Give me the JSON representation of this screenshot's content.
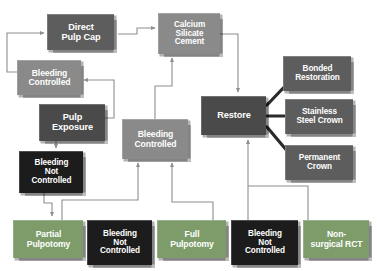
{
  "diagram": {
    "palette": {
      "gray_mid": "#8a8a8a",
      "gray_dark": "#5d5d5d",
      "charcoal": "#4a4a4a",
      "near_black": "#1c1c1c",
      "green": "#7d9c6a",
      "connector": "#8e8e8e",
      "connector_thick": "#2b2b2b",
      "background": "#ffffff",
      "text": "#ffffff"
    },
    "nodes": [
      {
        "id": "direct-pulp-cap",
        "label": "Direct\nPulp Cap",
        "theme": "t-gray-dark",
        "x": 47,
        "y": 14,
        "w": 67,
        "h": 36,
        "size": "fs-9"
      },
      {
        "id": "calcium-silicate-cement",
        "label": "Calcium\nSilicate\nCement",
        "theme": "t-gray-mid",
        "x": 158,
        "y": 13,
        "w": 62,
        "h": 41,
        "size": "fs-8"
      },
      {
        "id": "bleeding-controlled-1",
        "label": "Bleeding\nControlled",
        "theme": "t-gray-mid",
        "x": 17,
        "y": 60,
        "w": 64,
        "h": 35,
        "size": "fs-85"
      },
      {
        "id": "pulp-exposure",
        "label": "Pulp\nExposure",
        "theme": "t-charcoal",
        "x": 39,
        "y": 104,
        "w": 66,
        "h": 37,
        "size": "fs-9"
      },
      {
        "id": "bleeding-controlled-2",
        "label": "Bleeding\nControlled",
        "theme": "t-gray-mid",
        "x": 122,
        "y": 119,
        "w": 66,
        "h": 40,
        "size": "fs-85"
      },
      {
        "id": "restore",
        "label": "Restore",
        "theme": "t-charcoal",
        "x": 201,
        "y": 96,
        "w": 65,
        "h": 39,
        "size": "fs-9"
      },
      {
        "id": "bonded-restoration",
        "label": "Bonded\nRestoration",
        "theme": "t-gray-dark",
        "x": 283,
        "y": 56,
        "w": 68,
        "h": 35,
        "size": "fs-8"
      },
      {
        "id": "stainless-steel-crown",
        "label": "Stainless\nSteel Crown",
        "theme": "t-gray-dark",
        "x": 285,
        "y": 99,
        "w": 68,
        "h": 35,
        "size": "fs-8"
      },
      {
        "id": "permanent-crown",
        "label": "Permanent\nCrown",
        "theme": "t-gray-dark",
        "x": 285,
        "y": 145,
        "w": 68,
        "h": 35,
        "size": "fs-8"
      },
      {
        "id": "bleeding-not-controlled-1",
        "label": "Bleeding\nNot\nControlled",
        "theme": "t-near-black",
        "x": 19,
        "y": 151,
        "w": 64,
        "h": 42,
        "size": "fs-8"
      },
      {
        "id": "partial-pulpotomy",
        "label": "Partial\nPulpotomy",
        "theme": "t-green",
        "x": 13,
        "y": 220,
        "w": 70,
        "h": 38,
        "size": "fs-85"
      },
      {
        "id": "bleeding-not-controlled-2",
        "label": "Bleeding\nNot\nControlled",
        "theme": "t-near-black",
        "x": 87,
        "y": 220,
        "w": 65,
        "h": 45,
        "size": "fs-8"
      },
      {
        "id": "full-pulpotomy",
        "label": "Full\nPulpotomy",
        "theme": "t-green",
        "x": 157,
        "y": 220,
        "w": 69,
        "h": 38,
        "size": "fs-85"
      },
      {
        "id": "bleeding-not-controlled-3",
        "label": "Bleeding\nNot\nControlled",
        "theme": "t-near-black",
        "x": 231,
        "y": 220,
        "w": 67,
        "h": 45,
        "size": "fs-8"
      },
      {
        "id": "non-surgical-rct",
        "label": "Non-\nsurgical RCT",
        "theme": "t-green",
        "x": 303,
        "y": 220,
        "w": 66,
        "h": 38,
        "size": "fs-85"
      }
    ],
    "connections": [
      {
        "from": "direct-pulp-cap",
        "to": "calcium-silicate-cement",
        "style": "thin-arrow"
      },
      {
        "from": "bleeding-controlled-1",
        "to": "direct-pulp-cap",
        "style": "thin-arrow"
      },
      {
        "from": "pulp-exposure",
        "to": "bleeding-controlled-1",
        "style": "thin-arrow"
      },
      {
        "from": "pulp-exposure",
        "to": "bleeding-not-controlled-1",
        "style": "thin-arrow"
      },
      {
        "from": "bleeding-controlled-2",
        "to": "calcium-silicate-cement",
        "style": "thin-arrow"
      },
      {
        "from": "calcium-silicate-cement",
        "to": "restore",
        "style": "thin-arrow"
      },
      {
        "from": "restore",
        "to": "bonded-restoration",
        "style": "thick-line"
      },
      {
        "from": "restore",
        "to": "stainless-steel-crown",
        "style": "thick-line"
      },
      {
        "from": "restore",
        "to": "permanent-crown",
        "style": "thick-line"
      },
      {
        "from": "bleeding-not-controlled-1",
        "to": "partial-pulpotomy",
        "style": "thin-arrow"
      },
      {
        "from": "partial-pulpotomy",
        "to": "bleeding-controlled-2",
        "style": "thin-arrow"
      },
      {
        "from": "full-pulpotomy",
        "to": "bleeding-controlled-2",
        "style": "thin-arrow"
      },
      {
        "from": "bleeding-not-controlled-2",
        "to": "full-pulpotomy",
        "style": "thin-line"
      },
      {
        "from": "bleeding-not-controlled-3",
        "to": "restore",
        "style": "thin-arrow"
      },
      {
        "from": "non-surgical-rct",
        "to": "restore",
        "style": "thin-arrow"
      }
    ]
  }
}
